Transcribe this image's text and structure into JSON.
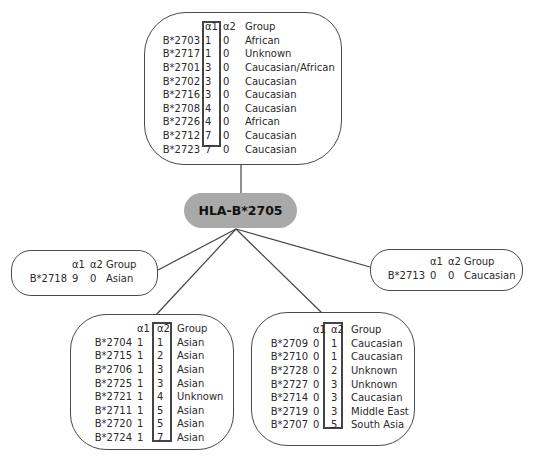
{
  "root": {
    "label": "HLA-B*2705",
    "color": "#a9a9a9"
  },
  "headers": {
    "a1": "α1",
    "a2": "α2",
    "group": "Group"
  },
  "top_box": {
    "highlight": "α1",
    "rows": [
      {
        "allele": "B*2703",
        "a1": "1",
        "a2": "0",
        "group": "African"
      },
      {
        "allele": "B*2717",
        "a1": "1",
        "a2": "0",
        "group": "Unknown"
      },
      {
        "allele": "B*2701",
        "a1": "3",
        "a2": "0",
        "group": "Caucasian/African"
      },
      {
        "allele": "B*2702",
        "a1": "3",
        "a2": "0",
        "group": "Caucasian"
      },
      {
        "allele": "B*2716",
        "a1": "3",
        "a2": "0",
        "group": "Caucasian"
      },
      {
        "allele": "B*2708",
        "a1": "4",
        "a2": "0",
        "group": "Caucasian"
      },
      {
        "allele": "B*2726",
        "a1": "4",
        "a2": "0",
        "group": "African"
      },
      {
        "allele": "B*2712",
        "a1": "7",
        "a2": "0",
        "group": "Caucasian"
      },
      {
        "allele": "B*2723",
        "a1": "7",
        "a2": "0",
        "group": "Caucasian"
      }
    ]
  },
  "left_box": {
    "rows": [
      {
        "allele": "B*2718",
        "a1": "9",
        "a2": "0",
        "group": "Asian"
      }
    ]
  },
  "right_box": {
    "rows": [
      {
        "allele": "B*2713",
        "a1": "0",
        "a2": "0",
        "group": "Caucasian"
      }
    ]
  },
  "bottom_left_box": {
    "highlight": "α2",
    "rows": [
      {
        "allele": "B*2704",
        "a1": "1",
        "a2": "1",
        "group": "Asian"
      },
      {
        "allele": "B*2715",
        "a1": "1",
        "a2": "2",
        "group": "Asian"
      },
      {
        "allele": "B*2706",
        "a1": "1",
        "a2": "3",
        "group": "Asian"
      },
      {
        "allele": "B*2725",
        "a1": "1",
        "a2": "3",
        "group": "Asian"
      },
      {
        "allele": "B*2721",
        "a1": "1",
        "a2": "4",
        "group": "Unknown"
      },
      {
        "allele": "B*2711",
        "a1": "1",
        "a2": "5",
        "group": "Asian"
      },
      {
        "allele": "B*2720",
        "a1": "1",
        "a2": "5",
        "group": "Asian"
      },
      {
        "allele": "B*2724",
        "a1": "1",
        "a2": "7",
        "group": "Asian"
      }
    ]
  },
  "bottom_right_box": {
    "highlight": "α2",
    "rows": [
      {
        "allele": "B*2709",
        "a1": "0",
        "a2": "1",
        "group": "Caucasian"
      },
      {
        "allele": "B*2710",
        "a1": "0",
        "a2": "1",
        "group": "Caucasian"
      },
      {
        "allele": "B*2728",
        "a1": "0",
        "a2": "2",
        "group": "Unknown"
      },
      {
        "allele": "B*2727",
        "a1": "0",
        "a2": "3",
        "group": "Unknown"
      },
      {
        "allele": "B*2714",
        "a1": "0",
        "a2": "3",
        "group": "Caucasian"
      },
      {
        "allele": "B*2719",
        "a1": "0",
        "a2": "3",
        "group": "Middle East"
      },
      {
        "allele": "B*2707",
        "a1": "0",
        "a2": "5",
        "group": "South Asia"
      }
    ]
  }
}
